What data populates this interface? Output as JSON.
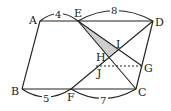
{
  "diagram": {
    "type": "parallelogram geometry figure",
    "points": {
      "A": "A",
      "E": "E",
      "D": "D",
      "B": "B",
      "F": "F",
      "C": "C",
      "G": "G",
      "H": "H",
      "I": "I",
      "J": "J"
    },
    "lengths": {
      "AE": "4",
      "ED": "8",
      "BF": "5",
      "FC": "7"
    },
    "segments": [
      "AD",
      "BC",
      "AB",
      "DC",
      "EC",
      "EG",
      "FD",
      "JG (dashed)"
    ],
    "shaded_region": "triangle EHI",
    "colors": {
      "line": "#222222",
      "shade": "#c8c8c8"
    }
  }
}
